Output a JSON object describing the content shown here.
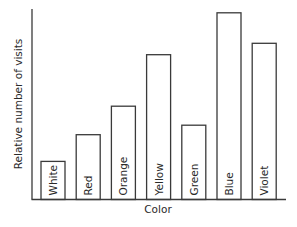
{
  "chart_data": {
    "type": "bar",
    "title": "",
    "xlabel": "Color",
    "ylabel": "Relative number of visits",
    "categories": [
      "White",
      "Red",
      "Orange",
      "Yellow",
      "Green",
      "Blue",
      "Violet"
    ],
    "values": [
      20,
      34,
      49,
      76,
      39,
      98,
      82
    ],
    "ylim": [
      0,
      100
    ],
    "grid": false,
    "legend": null,
    "bar_labels_inside": true,
    "y_ticks_shown": false
  }
}
